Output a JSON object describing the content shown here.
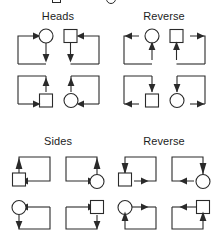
{
  "figure": {
    "type": "diagram",
    "background_color": "#ffffff",
    "line_color": "#2a2a2a",
    "node_fill": "#ffffff",
    "grid": {
      "rows": 2,
      "cols": 2
    }
  },
  "panels": [
    {
      "id": "panel-heads",
      "label": "Heads",
      "position": "top-left",
      "cells": [
        {
          "id": "heads-r1c1",
          "node": "circle",
          "node_pos": "top-right",
          "path": "left-up-right",
          "arrows": [
            "right-into-node-top",
            "down-from-node"
          ],
          "description": "Arrow travels up the left side, right into the circle at top; arrow exits circle downward."
        },
        {
          "id": "heads-r1c2",
          "node": "square",
          "node_pos": "top-left",
          "path": "right-up-left",
          "arrows": [
            "left-into-node-top",
            "down-from-node"
          ],
          "description": "Arrow travels up the right side, left into the square at top; arrow exits square downward."
        },
        {
          "id": "heads-r2c1",
          "node": "square",
          "node_pos": "bottom-right",
          "path": "left-down-right",
          "arrows": [
            "right-into-node-bottom",
            "up-into-node"
          ],
          "description": "Arrow comes from the left at bottom into the square; an arrow points up into the square from below."
        },
        {
          "id": "heads-r2c2",
          "node": "circle",
          "node_pos": "bottom-left",
          "path": "right-down-left",
          "arrows": [
            "left-into-node-bottom",
            "up-into-node"
          ],
          "description": "Arrow comes from the right at bottom into the circle; an arrow points up into the circle from below."
        }
      ]
    },
    {
      "id": "panel-heads-reverse",
      "label": "Reverse",
      "position": "top-right",
      "cells": [
        {
          "id": "hrev-r1c1",
          "node": "circle",
          "node_pos": "top-right",
          "path": "left-up-right",
          "arrows": [
            "left-out-of-node-top",
            "up-into-node"
          ],
          "description": "Arrow points left away from the circle along the top; arrow points up into the circle from below."
        },
        {
          "id": "hrev-r1c2",
          "node": "square",
          "node_pos": "top-left",
          "path": "right-up-left",
          "arrows": [
            "right-out-of-node-top",
            "up-into-node"
          ],
          "description": "Arrow points right away from the square along the top; arrow points up into the square from below."
        },
        {
          "id": "hrev-r2c1",
          "node": "square",
          "node_pos": "bottom-right",
          "path": "left-down-right",
          "arrows": [
            "down-into-node",
            "left-out-of-node-bottom"
          ],
          "description": "Arrow descends into the square from above; arrow exits the square leftward along the bottom."
        },
        {
          "id": "hrev-r2c2",
          "node": "circle",
          "node_pos": "bottom-left",
          "path": "right-down-left",
          "arrows": [
            "down-into-node",
            "right-out-of-node-bottom"
          ],
          "description": "Arrow descends into the circle from above; arrow exits the circle rightward along the bottom."
        }
      ]
    },
    {
      "id": "panel-sides",
      "label": "Sides",
      "position": "bottom-left",
      "cells": [
        {
          "id": "sides-r1c1",
          "node": "square",
          "node_pos": "left-middle",
          "path": "up-right-down",
          "arrows": [
            "up-into-node",
            "left-into-node-side"
          ],
          "description": "Arrow points up into the square from below; arrow travels leftward into the square's right side."
        },
        {
          "id": "sides-r1c2",
          "node": "circle",
          "node_pos": "right-middle",
          "path": "up-left-down",
          "arrows": [
            "up-into-node",
            "right-into-node-side"
          ],
          "description": "Arrow points up into the circle; arrow travels rightward into the circle's left side."
        },
        {
          "id": "sides-r2c1",
          "node": "circle",
          "node_pos": "left-middle",
          "path": "down-right-up",
          "arrows": [
            "left-into-node-side",
            "down-from-node"
          ],
          "description": "Arrow travels leftward into the circle; arrow exits the circle downward."
        },
        {
          "id": "sides-r2c2",
          "node": "square",
          "node_pos": "right-middle",
          "path": "down-left-up",
          "arrows": [
            "right-into-node-side",
            "down-from-node"
          ],
          "description": "Arrow travels rightward into the square; arrow exits the square downward."
        }
      ]
    },
    {
      "id": "panel-sides-reverse",
      "label": "Reverse",
      "position": "bottom-right",
      "cells": [
        {
          "id": "srev-r1c1",
          "node": "square",
          "node_pos": "left-middle",
          "path": "up-right-down",
          "arrows": [
            "down-into-node",
            "right-out-of-node-side"
          ],
          "description": "Arrow descends into the square from above; arrow exits the square rightward."
        },
        {
          "id": "srev-r1c2",
          "node": "circle",
          "node_pos": "right-middle",
          "path": "up-left-down",
          "arrows": [
            "down-into-node",
            "left-out-of-node-side"
          ],
          "description": "Arrow descends into the circle from above; arrow exits the circle leftward."
        },
        {
          "id": "srev-r2c1",
          "node": "circle",
          "node_pos": "left-middle",
          "path": "down-right-up",
          "arrows": [
            "right-out-of-node-side",
            "up-into-node"
          ],
          "description": "Arrow exits the circle rightward; arrow points up into the circle from below."
        },
        {
          "id": "srev-r2c2",
          "node": "square",
          "node_pos": "right-middle",
          "path": "down-left-up",
          "arrows": [
            "left-out-of-node-side",
            "up-into-node"
          ],
          "description": "Arrow exits the square leftward; arrow points up into the square from below."
        }
      ]
    }
  ]
}
